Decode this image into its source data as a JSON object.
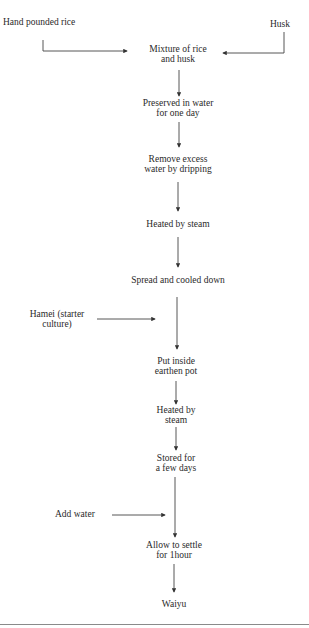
{
  "diagram": {
    "type": "flowchart",
    "inputs": [
      {
        "id": "hand_pounded_rice",
        "label": "Hand pounded rice"
      },
      {
        "id": "husk",
        "label": "Husk"
      },
      {
        "id": "hamei",
        "line1": "Hamei (starter",
        "line2": "culture)"
      },
      {
        "id": "add_water",
        "label": "Add water"
      }
    ],
    "steps": [
      {
        "id": "mixture",
        "line1": "Mixture of rice",
        "line2": "and husk"
      },
      {
        "id": "preserved",
        "line1": "Preserved in water",
        "line2": "for one day"
      },
      {
        "id": "remove_water",
        "line1": "Remove excess",
        "line2": "water by dripping"
      },
      {
        "id": "heated1",
        "line1": "Heated by steam"
      },
      {
        "id": "spread",
        "line1": "Spread and cooled down"
      },
      {
        "id": "put_pot",
        "line1": "Put inside",
        "line2": "earthen pot"
      },
      {
        "id": "heated2",
        "line1": "Heated by",
        "line2": "steam"
      },
      {
        "id": "stored",
        "line1": "Stored for",
        "line2": "a few days"
      },
      {
        "id": "settle",
        "line1": "Allow to settle",
        "line2": "for 1hour"
      },
      {
        "id": "waiyu",
        "line1": "Waiyu"
      }
    ],
    "edges": [
      [
        "hand_pounded_rice",
        "mixture"
      ],
      [
        "husk",
        "mixture"
      ],
      [
        "mixture",
        "preserved"
      ],
      [
        "preserved",
        "remove_water"
      ],
      [
        "remove_water",
        "heated1"
      ],
      [
        "heated1",
        "spread"
      ],
      [
        "spread",
        "put_pot"
      ],
      [
        "hamei",
        "put_pot"
      ],
      [
        "put_pot",
        "heated2"
      ],
      [
        "heated2",
        "stored"
      ],
      [
        "stored",
        "settle"
      ],
      [
        "add_water",
        "settle"
      ],
      [
        "settle",
        "waiyu"
      ]
    ]
  }
}
